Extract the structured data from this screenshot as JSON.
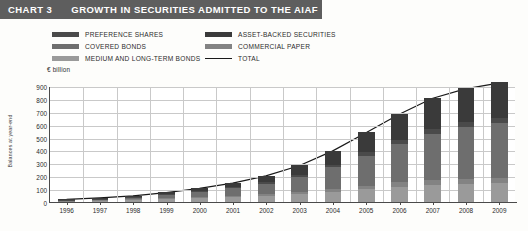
{
  "header": {
    "chart_number": "CHART 3",
    "title": "GROWTH IN SECURITIES ADMITTED TO THE AIAF",
    "bar_color": "#5e5e5e",
    "text_color": "#ffffff"
  },
  "legend": {
    "left_column": [
      {
        "label": "PREFERENCE SHARES",
        "color": "#4a4a4a",
        "type": "swatch"
      },
      {
        "label": "COVERED BONDS",
        "color": "#6e6e6e",
        "type": "swatch"
      },
      {
        "label": "MEDIUM AND LONG-TERM BONDS",
        "color": "#9a9a9a",
        "type": "swatch"
      }
    ],
    "right_column": [
      {
        "label": "ASSET-BACKED SECURITIES",
        "color": "#3a3a3a",
        "type": "swatch"
      },
      {
        "label": "COMMERCIAL PAPER",
        "color": "#838383",
        "type": "swatch"
      },
      {
        "label": "TOTAL",
        "color": "#1a1a1a",
        "type": "line"
      }
    ]
  },
  "chart_data": {
    "type": "bar",
    "stacked": true,
    "title": "GROWTH IN SECURITIES ADMITTED TO THE AIAF",
    "unit_label": "€ billion",
    "xlabel": "",
    "ylabel": "Balances at year-end",
    "ylim": [
      0,
      900
    ],
    "ytick_step": 100,
    "yticks": [
      0,
      100,
      200,
      300,
      400,
      500,
      600,
      700,
      800,
      900
    ],
    "grid": true,
    "legend_position": "top",
    "categories": [
      "1996",
      "1997",
      "1998",
      "1999",
      "2000",
      "2001",
      "2002",
      "2003",
      "2004",
      "2005",
      "2006",
      "2007",
      "2008",
      "2009"
    ],
    "series": [
      {
        "name": "MEDIUM AND LONG-TERM BONDS",
        "color": "#9a9a9a",
        "values": [
          8,
          12,
          17,
          24,
          30,
          38,
          48,
          62,
          80,
          100,
          118,
          132,
          140,
          146
        ]
      },
      {
        "name": "COMMERCIAL PAPER",
        "color": "#838383",
        "values": [
          2,
          3,
          4,
          6,
          8,
          10,
          13,
          17,
          22,
          28,
          34,
          38,
          40,
          42
        ]
      },
      {
        "name": "COVERED BONDS",
        "color": "#6e6e6e",
        "values": [
          6,
          10,
          16,
          26,
          40,
          58,
          82,
          116,
          166,
          232,
          300,
          360,
          400,
          424
        ]
      },
      {
        "name": "PREFERENCE SHARES",
        "color": "#4a4a4a",
        "values": [
          1,
          2,
          3,
          4,
          6,
          8,
          11,
          15,
          20,
          26,
          31,
          35,
          37,
          38
        ]
      },
      {
        "name": "ASSET-BACKED SECURITIES",
        "color": "#3a3a3a",
        "values": [
          3,
          5,
          8,
          14,
          22,
          34,
          50,
          74,
          110,
          154,
          202,
          245,
          268,
          280
        ]
      }
    ],
    "total": {
      "name": "TOTAL",
      "color": "#1a1a1a",
      "values": [
        20,
        32,
        48,
        74,
        106,
        148,
        204,
        284,
        398,
        540,
        685,
        810,
        885,
        930
      ]
    }
  }
}
